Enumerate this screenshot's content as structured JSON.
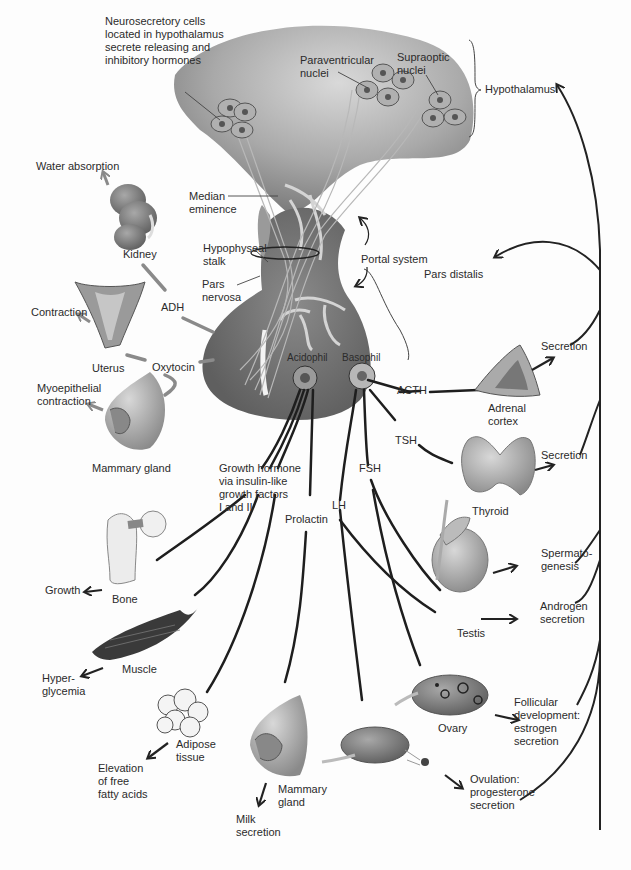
{
  "diagram": {
    "title_structures": {
      "hypothalamus": "Hypothalamus",
      "neurosecretory": "Neurosecretory cells\nlocated in hypothalamus\nsecrete releasing and\ninhibitory hormones",
      "paraventricular": "Paraventricular\nnuclei",
      "supraoptic": "Supraoptic\nnuclei",
      "median_eminence": "Median\neminence",
      "hypophyseal_stalk": "Hypophyseal\nstalk",
      "pars_nervosa": "Pars\nnervosa",
      "portal_system": "Portal system",
      "pars_distalis": "Pars distalis",
      "acidophil": "Acidophil",
      "basophil": "Basophil"
    },
    "hormones": {
      "adh": "ADH",
      "oxytocin": "Oxytocin",
      "acth": "ACTH",
      "tsh": "TSH",
      "fsh": "FSH",
      "lh": "LH",
      "prolactin": "Prolactin",
      "growth_hormone": "Growth hormone\nvia insulin-like\ngrowth factors\nI and II"
    },
    "targets": {
      "kidney": "Kidney",
      "uterus": "Uterus",
      "mammary_gland_top": "Mammary gland",
      "adrenal_cortex": "Adrenal\ncortex",
      "thyroid": "Thyroid",
      "testis": "Testis",
      "ovary": "Ovary",
      "bone": "Bone",
      "muscle": "Muscle",
      "adipose": "Adipose\ntissue",
      "mammary_gland_bottom": "Mammary\ngland"
    },
    "effects": {
      "water_absorption": "Water absorption",
      "contraction": "Contraction",
      "myoepithelial": "Myoepithelial\ncontraction",
      "adrenal_secretion": "Secretion",
      "thyroid_secretion": "Secretion",
      "spermatogenesis": "Spermato-\ngenesis",
      "androgen": "Androgen\nsecretion",
      "follicular": "Follicular\ndevelopment:\nestrogen\nsecretion",
      "ovulation": "Ovulation:\nprogesterone\nsecretion",
      "growth": "Growth",
      "hyperglycemia": "Hyper-\nglycemia",
      "fatty_acids": "Elevation\nof free\nfatty acids",
      "milk": "Milk\nsecretion"
    },
    "colors": {
      "tissue_dark": "#6e6e6e",
      "tissue_mid": "#8c8c8c",
      "tissue_light": "#c8c8c8",
      "line": "#222222",
      "arrow_grey": "#8a8a8a",
      "background": "#fdfdfd"
    }
  }
}
